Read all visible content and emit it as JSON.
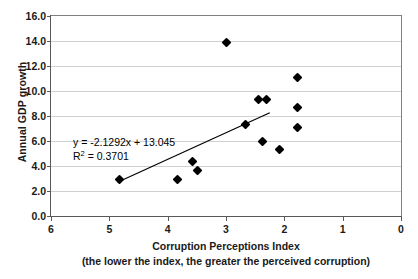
{
  "chart_data": {
    "type": "scatter",
    "title": "",
    "xlabel": "Corruption Perceptions Index",
    "xlabel_note": "(the lower the index, the greater the perceived corruption)",
    "ylabel": "Annual GDP growth",
    "xlim": [
      6,
      0
    ],
    "ylim": [
      0.0,
      16.0
    ],
    "x_reversed": true,
    "grid": "horizontal",
    "legend": "none",
    "xticks": [
      "6",
      "5",
      "4",
      "3",
      "2",
      "1",
      "0"
    ],
    "xtick_values": [
      6,
      5,
      4,
      3,
      2,
      1,
      0
    ],
    "yticks": [
      "0.0",
      "2.0",
      "4.0",
      "6.0",
      "8.0",
      "10.0",
      "12.0",
      "14.0",
      "16.0"
    ],
    "ytick_values": [
      0,
      2,
      4,
      6,
      8,
      10,
      12,
      14,
      16
    ],
    "marker": "diamond",
    "marker_color": "#000000",
    "points": [
      {
        "x": 4.82,
        "y": 2.9
      },
      {
        "x": 3.83,
        "y": 2.9
      },
      {
        "x": 3.58,
        "y": 4.4
      },
      {
        "x": 3.49,
        "y": 3.65
      },
      {
        "x": 3.0,
        "y": 13.9
      },
      {
        "x": 2.67,
        "y": 7.3
      },
      {
        "x": 2.44,
        "y": 9.3
      },
      {
        "x": 2.31,
        "y": 9.3
      },
      {
        "x": 2.38,
        "y": 6.0
      },
      {
        "x": 2.09,
        "y": 5.3
      },
      {
        "x": 1.78,
        "y": 11.1
      },
      {
        "x": 1.78,
        "y": 8.7
      },
      {
        "x": 1.78,
        "y": 7.1
      }
    ],
    "trendline": {
      "slope": -2.1292,
      "intercept": 13.045,
      "x_start": 4.86,
      "x_end": 2.25,
      "color": "#000000"
    },
    "annotations": {
      "equation": "y = -2.1292x + 13.045",
      "r_squared_prefix": "R",
      "r_squared_sup": "2",
      "r_squared_value": " = 0.3701"
    }
  }
}
